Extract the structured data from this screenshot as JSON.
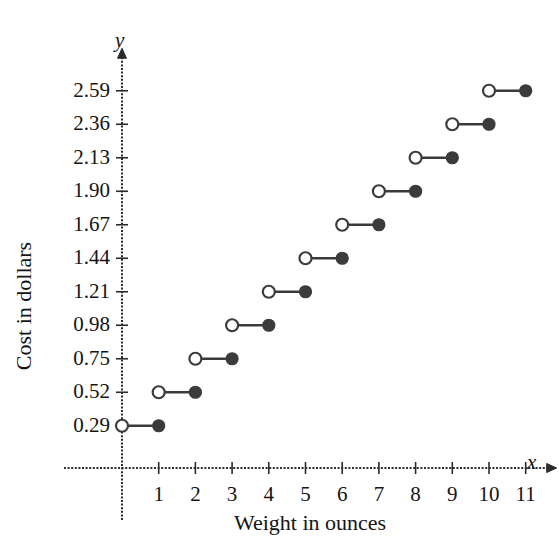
{
  "chart_data": {
    "type": "line",
    "subtype": "step-function",
    "title": "",
    "xlabel": "Weight in ounces",
    "ylabel": "Cost in dollars",
    "x_axis_letter": "x",
    "y_axis_letter": "y",
    "xlim": [
      0,
      11.6
    ],
    "ylim": [
      0,
      2.82
    ],
    "grid": false,
    "legend": null,
    "x_ticks": [
      1,
      2,
      3,
      4,
      5,
      6,
      7,
      8,
      9,
      10,
      11
    ],
    "x_tick_labels": [
      "1",
      "2",
      "3",
      "4",
      "5",
      "6",
      "7",
      "8",
      "9",
      "10",
      "11"
    ],
    "y_ticks": [
      0.29,
      0.52,
      0.75,
      0.98,
      1.21,
      1.44,
      1.67,
      1.9,
      2.13,
      2.36,
      2.59
    ],
    "y_tick_labels": [
      "0.29",
      "0.52",
      "0.75",
      "0.98",
      "1.21",
      "1.44",
      "1.67",
      "1.90",
      "2.13",
      "2.36",
      "2.59"
    ],
    "series_color": "#3b3b3b",
    "open_endpoint_fill": "#ffffff",
    "steps": [
      {
        "x_start": 0,
        "x_end": 1,
        "y": 0.29,
        "left_endpoint": "open",
        "right_endpoint": "closed"
      },
      {
        "x_start": 1,
        "x_end": 2,
        "y": 0.52,
        "left_endpoint": "open",
        "right_endpoint": "closed"
      },
      {
        "x_start": 2,
        "x_end": 3,
        "y": 0.75,
        "left_endpoint": "open",
        "right_endpoint": "closed"
      },
      {
        "x_start": 3,
        "x_end": 4,
        "y": 0.98,
        "left_endpoint": "open",
        "right_endpoint": "closed"
      },
      {
        "x_start": 4,
        "x_end": 5,
        "y": 1.21,
        "left_endpoint": "open",
        "right_endpoint": "closed"
      },
      {
        "x_start": 5,
        "x_end": 6,
        "y": 1.44,
        "left_endpoint": "open",
        "right_endpoint": "closed"
      },
      {
        "x_start": 6,
        "x_end": 7,
        "y": 1.67,
        "left_endpoint": "open",
        "right_endpoint": "closed"
      },
      {
        "x_start": 7,
        "x_end": 8,
        "y": 1.9,
        "left_endpoint": "open",
        "right_endpoint": "closed"
      },
      {
        "x_start": 8,
        "x_end": 9,
        "y": 2.13,
        "left_endpoint": "open",
        "right_endpoint": "closed"
      },
      {
        "x_start": 9,
        "x_end": 10,
        "y": 2.36,
        "left_endpoint": "open",
        "right_endpoint": "closed"
      },
      {
        "x_start": 10,
        "x_end": 11,
        "y": 2.59,
        "left_endpoint": "open",
        "right_endpoint": "closed"
      }
    ]
  }
}
